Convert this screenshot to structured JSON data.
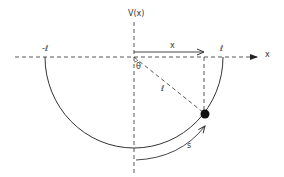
{
  "diagram": {
    "type": "pendulum-potential",
    "labels": {
      "y_axis": "V(x)",
      "x_axis": "x",
      "left_end": "-ℓ",
      "right_end": "ℓ",
      "displacement": "x",
      "angle": "θ",
      "length": "ℓ",
      "arc_length": "s"
    },
    "colors": {
      "stroke": "#333333",
      "dashed": "#444444",
      "mass": "#111111",
      "background": "#ffffff"
    },
    "geometry": {
      "origin": [
        134,
        57
      ],
      "radius": 89,
      "mass_position": [
        205,
        114
      ]
    }
  }
}
